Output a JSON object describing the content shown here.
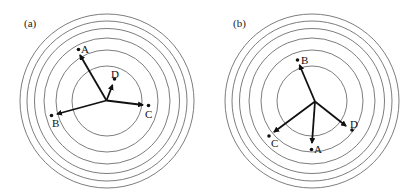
{
  "figure": {
    "panels": [
      {
        "label": "(a)",
        "label_pos": [
          24,
          27
        ],
        "center": [
          107,
          101
        ],
        "radii": [
          35,
          51,
          63,
          72.5,
          80,
          87
        ],
        "origin": [
          106.5,
          100.5
        ],
        "points": [
          {
            "name": "A",
            "dot": [
              78.5,
              49.5
            ],
            "label_pos": [
              81,
              53
            ],
            "arrow_to": [
              80,
              55
            ]
          },
          {
            "name": "B",
            "dot": [
              51.5,
              115.5
            ],
            "label_pos": [
              52,
              127
            ],
            "arrow_to": [
              57,
              114
            ]
          },
          {
            "name": "C",
            "dot": [
              148.5,
              105.5
            ],
            "label_pos": [
              145,
              118
            ],
            "arrow_to": [
              143,
              105
            ]
          },
          {
            "name": "D",
            "dot": [
              114.5,
              79
            ],
            "label_pos": [
              111,
              78
            ],
            "arrow_to": [
              112.5,
              85
            ]
          }
        ]
      },
      {
        "label": "(b)",
        "label_pos": [
          233,
          27
        ],
        "center": [
          312,
          101
        ],
        "radii": [
          35,
          51,
          63,
          72.5,
          80,
          87
        ],
        "origin": [
          315,
          101.5
        ],
        "points": [
          {
            "name": "B",
            "dot": [
              297.5,
              60
            ],
            "label_pos": [
              301,
              64
            ],
            "arrow_to": [
              299.5,
              65
            ]
          },
          {
            "name": "C",
            "dot": [
              269,
              136
            ],
            "label_pos": [
              271,
              147
            ],
            "arrow_to": [
              274,
              132
            ]
          },
          {
            "name": "A",
            "dot": [
              311.5,
              149.5
            ],
            "label_pos": [
              314,
              153
            ],
            "arrow_to": [
              312,
              143
            ]
          },
          {
            "name": "D",
            "dot": [
              352,
              130
            ],
            "label_pos": [
              350,
              128
            ],
            "arrow_to": [
              346,
              126
            ]
          }
        ]
      }
    ]
  }
}
